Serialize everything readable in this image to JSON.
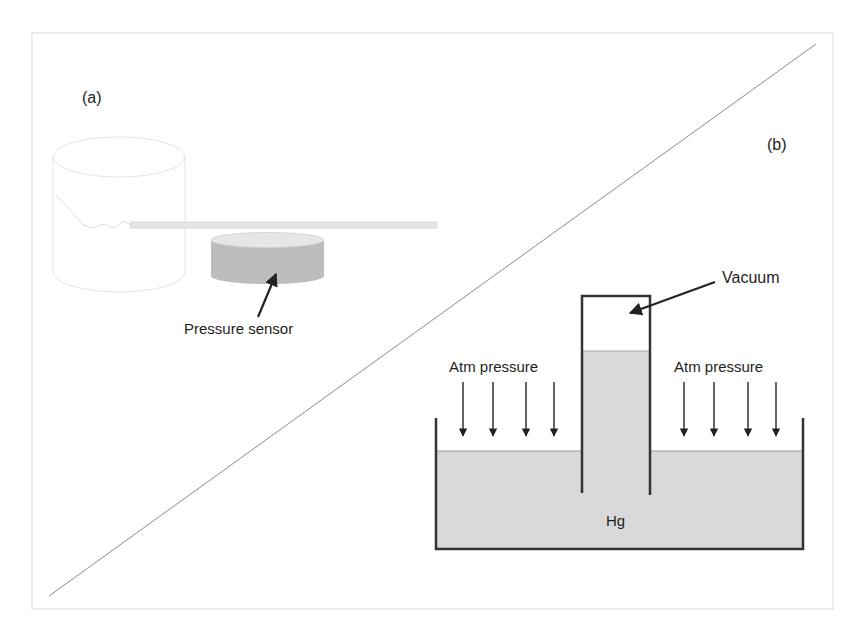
{
  "panels": {
    "a": {
      "label": "(a)",
      "sensor_label": "Pressure sensor"
    },
    "b": {
      "label": "(b)",
      "vacuum_label": "Vacuum",
      "atm_left_label": "Atm pressure",
      "atm_right_label": "Atm pressure",
      "fluid_label": "Hg"
    }
  },
  "colors": {
    "frame": "#d8d8d8",
    "diagonal": "#8c8c8c",
    "mercury": "#d9d9d9",
    "sensor": "#bdbdbd",
    "outline": "#333333"
  }
}
